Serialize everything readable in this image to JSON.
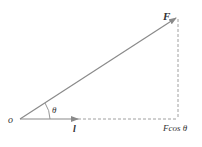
{
  "diagram": {
    "origin_label": "o",
    "force_label": "F",
    "direction_label": "l",
    "angle_label": "θ",
    "projection_label": "Fcos θ",
    "colors": {
      "vector": "#8a8a8a",
      "dashed": "#888888",
      "text": "#333333"
    }
  }
}
